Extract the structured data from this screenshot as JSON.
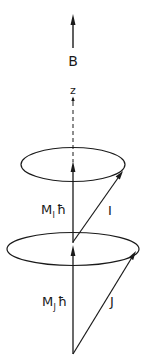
{
  "diagram": {
    "labels": {
      "field": "B",
      "axis": "z",
      "mi_main": "M",
      "mi_sub": "I",
      "mi_hbar": "ħ",
      "i_vector": "I",
      "mj_main": "M",
      "mj_sub": "J",
      "mj_hbar": "ħ",
      "j_vector": "J"
    },
    "colors": {
      "ink": "#1a1a1a",
      "background": "#ffffff"
    },
    "elements": [
      {
        "id": "B",
        "kind": "arrow",
        "description": "Magnetic field direction, pointing up"
      },
      {
        "id": "z",
        "kind": "axis",
        "description": "Quantization axis, dashed"
      },
      {
        "id": "upper-cone",
        "kind": "ellipse",
        "description": "Precession circle of I about z"
      },
      {
        "id": "MI-hbar",
        "kind": "arrow",
        "description": "Projection of I on z axis"
      },
      {
        "id": "I",
        "kind": "vector",
        "description": "Nuclear spin vector"
      },
      {
        "id": "lower-cone",
        "kind": "ellipse",
        "description": "Precession circle of J about z"
      },
      {
        "id": "MJ-hbar",
        "kind": "arrow",
        "description": "Projection of J on z axis"
      },
      {
        "id": "J",
        "kind": "vector",
        "description": "Electronic angular momentum vector"
      }
    ]
  }
}
